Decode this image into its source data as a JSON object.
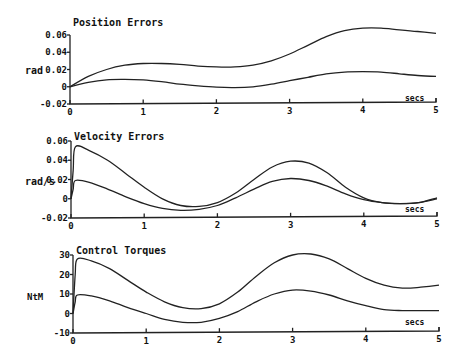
{
  "chart_data": [
    {
      "type": "line",
      "title": "Position Errors",
      "ylabel": "rad",
      "xlabel": "secs",
      "yticks": [
        "0.06",
        "0.04",
        "0.02",
        "0",
        "-0.02"
      ],
      "ytick_values": [
        0.06,
        0.04,
        0.02,
        0,
        -0.02
      ],
      "xticks": [
        "0",
        "1",
        "2",
        "3",
        "4",
        "5"
      ],
      "xlim": [
        0,
        5
      ],
      "ylim": [
        -0.02,
        0.06
      ],
      "grid": false,
      "x": [
        0,
        0.25,
        0.5,
        0.75,
        1.0,
        1.25,
        1.5,
        1.75,
        2.0,
        2.25,
        2.5,
        2.75,
        3.0,
        3.25,
        3.5,
        3.75,
        4.0,
        4.25,
        4.5,
        4.75,
        5.0
      ],
      "series": [
        {
          "name": "upper",
          "values": [
            0,
            0.012,
            0.02,
            0.025,
            0.027,
            0.027,
            0.026,
            0.024,
            0.023,
            0.023,
            0.025,
            0.03,
            0.038,
            0.048,
            0.058,
            0.065,
            0.068,
            0.068,
            0.066,
            0.064,
            0.062
          ]
        },
        {
          "name": "lower",
          "values": [
            0,
            0.005,
            0.008,
            0.0085,
            0.008,
            0.006,
            0.003,
            0.001,
            -0.0005,
            -0.001,
            0.0,
            0.003,
            0.007,
            0.011,
            0.015,
            0.017,
            0.0175,
            0.017,
            0.015,
            0.013,
            0.012
          ]
        }
      ],
      "box": {
        "x0": 70,
        "x1": 436,
        "y_top": 35,
        "y_bottom": 104
      }
    },
    {
      "type": "line",
      "title": "Velocity Errors",
      "ylabel": "rad/s",
      "xlabel": "secs",
      "yticks": [
        "0.06",
        "0.04",
        "0.02",
        "0",
        "-0.02"
      ],
      "ytick_values": [
        0.06,
        0.04,
        0.02,
        0,
        -0.02
      ],
      "xticks": [
        "0",
        "1",
        "2",
        "3",
        "4",
        "5"
      ],
      "xlim": [
        0,
        5
      ],
      "ylim": [
        -0.02,
        0.06
      ],
      "grid": false,
      "x": [
        0,
        0.03,
        0.06,
        0.25,
        0.5,
        0.75,
        1.0,
        1.25,
        1.5,
        1.75,
        2.0,
        2.25,
        2.5,
        2.75,
        3.0,
        3.25,
        3.5,
        3.75,
        4.0,
        4.25,
        4.5,
        4.75,
        5.0
      ],
      "series": [
        {
          "name": "upper",
          "values": [
            0,
            0.03,
            0.054,
            0.05,
            0.04,
            0.026,
            0.012,
            0.0,
            -0.007,
            -0.008,
            -0.004,
            0.006,
            0.02,
            0.033,
            0.039,
            0.037,
            0.027,
            0.012,
            0.001,
            -0.004,
            -0.005,
            -0.004,
            0.001
          ]
        },
        {
          "name": "lower",
          "values": [
            0,
            0.01,
            0.019,
            0.017,
            0.01,
            0.002,
            -0.005,
            -0.01,
            -0.012,
            -0.011,
            -0.007,
            0.001,
            0.01,
            0.018,
            0.021,
            0.019,
            0.013,
            0.005,
            -0.001,
            -0.004,
            -0.005,
            -0.004,
            0.0
          ]
        }
      ],
      "box": {
        "x0": 71,
        "x1": 437,
        "y_top": 141,
        "y_bottom": 218
      }
    },
    {
      "type": "line",
      "title": "Control Torques",
      "ylabel": "NtM",
      "xlabel": "secs",
      "yticks": [
        "30",
        "20",
        "10",
        "0",
        "-10"
      ],
      "ytick_values": [
        30,
        20,
        10,
        0,
        -10
      ],
      "xticks": [
        "0",
        "1",
        "2",
        "3",
        "4",
        "5"
      ],
      "xlim": [
        0,
        5
      ],
      "ylim": [
        -10,
        30
      ],
      "grid": false,
      "x": [
        0,
        0.03,
        0.06,
        0.25,
        0.5,
        0.75,
        1.0,
        1.25,
        1.5,
        1.75,
        2.0,
        2.25,
        2.5,
        2.75,
        3.0,
        3.25,
        3.5,
        3.75,
        4.0,
        4.25,
        4.5,
        4.75,
        5.0
      ],
      "series": [
        {
          "name": "upper",
          "values": [
            0,
            20,
            28,
            27,
            23,
            17,
            11,
            6,
            3,
            2.5,
            5,
            11,
            19,
            26,
            30,
            30.5,
            28,
            23,
            18,
            14.5,
            13,
            13.5,
            14.5
          ]
        },
        {
          "name": "lower",
          "values": [
            0,
            6,
            9.5,
            9,
            6.5,
            3,
            0,
            -3,
            -4.5,
            -4.5,
            -2.5,
            1,
            6,
            10,
            12,
            11.5,
            9.5,
            6.5,
            4,
            2,
            1.5,
            1.5,
            1.5
          ]
        }
      ],
      "box": {
        "x0": 73,
        "x1": 439,
        "y_top": 255,
        "y_bottom": 333
      }
    }
  ]
}
